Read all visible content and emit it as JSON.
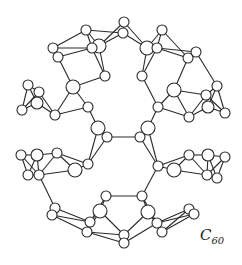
{
  "diagram": {
    "label": {
      "main": "C",
      "subscript": "60"
    },
    "colors": {
      "bond": "#2a2a2a",
      "atom_fill": "#ffffff",
      "atom_stroke": "#2a2a2a"
    },
    "atoms": [
      [
        124,
        22,
        5
      ],
      [
        123,
        33,
        5
      ],
      [
        86,
        30,
        5
      ],
      [
        162,
        30,
        5
      ],
      [
        99,
        46,
        7
      ],
      [
        92,
        48,
        5
      ],
      [
        147,
        48,
        7
      ],
      [
        157,
        48,
        5
      ],
      [
        53,
        48,
        5
      ],
      [
        58,
        57,
        5
      ],
      [
        196,
        52,
        5
      ],
      [
        188,
        58,
        5
      ],
      [
        105,
        76,
        5
      ],
      [
        142,
        76,
        5
      ],
      [
        73,
        87,
        7
      ],
      [
        174,
        90,
        7
      ],
      [
        28,
        85,
        5
      ],
      [
        39,
        92,
        5
      ],
      [
        37,
        103,
        6
      ],
      [
        22,
        110,
        5
      ],
      [
        217,
        86,
        5
      ],
      [
        206,
        95,
        5
      ],
      [
        208,
        107,
        6
      ],
      [
        225,
        113,
        5
      ],
      [
        88,
        107,
        5
      ],
      [
        158,
        107,
        5
      ],
      [
        55,
        115,
        5
      ],
      [
        189,
        117,
        5
      ],
      [
        98,
        128,
        7
      ],
      [
        148,
        128,
        7
      ],
      [
        107,
        137,
        5
      ],
      [
        140,
        137,
        5
      ],
      [
        21,
        155,
        5
      ],
      [
        37,
        155,
        6
      ],
      [
        57,
        153,
        5
      ],
      [
        189,
        155,
        5
      ],
      [
        208,
        155,
        6
      ],
      [
        225,
        157,
        5
      ],
      [
        88,
        164,
        5
      ],
      [
        158,
        166,
        5
      ],
      [
        75,
        170,
        7
      ],
      [
        174,
        170,
        7
      ],
      [
        28,
        175,
        5
      ],
      [
        39,
        175,
        5
      ],
      [
        207,
        175,
        5
      ],
      [
        217,
        178,
        5
      ],
      [
        106,
        196,
        5
      ],
      [
        142,
        196,
        5
      ],
      [
        100,
        211,
        7
      ],
      [
        148,
        212,
        7
      ],
      [
        55,
        208,
        5
      ],
      [
        52,
        215,
        5
      ],
      [
        189,
        209,
        5
      ],
      [
        194,
        214,
        5
      ],
      [
        90,
        222,
        5
      ],
      [
        87,
        232,
        5
      ],
      [
        157,
        223,
        5
      ],
      [
        162,
        232,
        5
      ],
      [
        124,
        235,
        5
      ],
      [
        124,
        243,
        5
      ]
    ]
  }
}
